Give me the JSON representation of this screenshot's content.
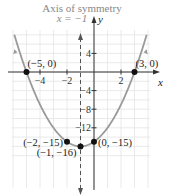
{
  "chart_data": {
    "type": "line",
    "title": "",
    "function": "y = x^2 + 2x - 15",
    "xlabel": "x",
    "ylabel": "y",
    "xlim": [
      -6.5,
      5.2
    ],
    "ylim": [
      -17.5,
      8
    ],
    "x_ticks": [
      -4,
      -2,
      2
    ],
    "y_ticks": [
      4,
      -4,
      -8,
      -12
    ],
    "x_tick_labels": [
      "−4",
      "−2",
      "2"
    ],
    "y_tick_labels": [
      "4",
      "−4",
      "−8",
      "−12"
    ],
    "grid": true,
    "axis_of_symmetry": {
      "label_line1": "Axis of symmetry",
      "label_line2": "x = −1",
      "x": -1
    },
    "points": [
      {
        "x": -5,
        "y": 0,
        "label": "(−5, 0)"
      },
      {
        "x": 3,
        "y": 0,
        "label": "(3, 0)"
      },
      {
        "x": -2,
        "y": -15,
        "label": "(−2, −15)"
      },
      {
        "x": 0,
        "y": -15,
        "label": "(0, −15)"
      },
      {
        "x": -1,
        "y": -16,
        "label": "(−1, −16)"
      }
    ],
    "colors": {
      "curve": "#9a9a9a",
      "axis": "#333333",
      "grid": "#e4e4e4",
      "point": "#111111",
      "annotation": "#888888"
    }
  }
}
